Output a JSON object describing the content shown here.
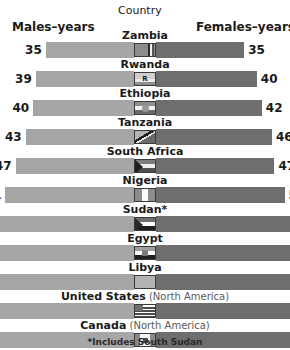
{
  "header": {
    "males_label": "Males–years",
    "females_label": "Females–years",
    "country_label": "Country"
  },
  "footnote": "*Includes South Sudan",
  "colors": {
    "male_bar": "#a6a6a6",
    "female_bar": "#6e6e6e",
    "text": "#1a1a1a",
    "sub_text": "#5a5a5a",
    "background": "#ffffff"
  },
  "chart_data": {
    "type": "bar",
    "title": "Country",
    "subtitle": "",
    "xlabel": "",
    "ylabel": "Country",
    "orientation": "horizontal-diverging",
    "grid": false,
    "legend_position": "top",
    "axis_center_value": 0,
    "categories": [
      "Zambia",
      "Rwanda",
      "Ethiopia",
      "Tanzania",
      "South Africa",
      "Nigeria",
      "Sudan*",
      "Egypt",
      "Libya",
      "United States",
      "Canada"
    ],
    "series": [
      {
        "name": "Males–years",
        "direction": "left",
        "color": "#a6a6a6",
        "values": [
          35,
          39,
          40,
          43,
          47,
          51,
          57,
          68,
          74,
          74,
          76
        ]
      },
      {
        "name": "Females–years",
        "direction": "right",
        "color": "#6e6e6e",
        "values": [
          35,
          40,
          42,
          46,
          47,
          51,
          59,
          73,
          78,
          80,
          83
        ]
      }
    ],
    "annotations": [
      "*Includes South Sudan"
    ]
  },
  "rows": [
    {
      "country": "Zambia",
      "sub": "",
      "male": "35",
      "female": "35",
      "male_val": 35,
      "female_val": 35,
      "flag": "zambia-flag"
    },
    {
      "country": "Rwanda",
      "sub": "",
      "male": "39",
      "female": "40",
      "male_val": 39,
      "female_val": 40,
      "flag": "rwanda-flag"
    },
    {
      "country": "Ethiopia",
      "sub": "",
      "male": "40",
      "female": "42",
      "male_val": 40,
      "female_val": 42,
      "flag": "ethiopia-flag"
    },
    {
      "country": "Tanzania",
      "sub": "",
      "male": "43",
      "female": "46",
      "male_val": 43,
      "female_val": 46,
      "flag": "tanzania-flag"
    },
    {
      "country": "South Africa",
      "sub": "",
      "male": "47",
      "female": "47",
      "male_val": 47,
      "female_val": 47,
      "flag": "south-africa-flag"
    },
    {
      "country": "Nigeria",
      "sub": "",
      "male": "51",
      "female": "51",
      "male_val": 51,
      "female_val": 51,
      "flag": "nigeria-flag"
    },
    {
      "country": "Sudan*",
      "sub": "",
      "male": "57",
      "female": "59",
      "male_val": 57,
      "female_val": 59,
      "flag": "sudan-flag"
    },
    {
      "country": "Egypt",
      "sub": "",
      "male": "68",
      "female": "73",
      "male_val": 68,
      "female_val": 73,
      "flag": "egypt-flag"
    },
    {
      "country": "Libya",
      "sub": "",
      "male": "74",
      "female": "78",
      "male_val": 74,
      "female_val": 78,
      "flag": "libya-flag"
    },
    {
      "country": "United States",
      "sub": " (North America)",
      "male": "74",
      "female": "80",
      "male_val": 74,
      "female_val": 80,
      "flag": "usa-flag"
    },
    {
      "country": "Canada",
      "sub": " (North America)",
      "male": "76",
      "female": "83",
      "male_val": 76,
      "female_val": 83,
      "flag": "canada-flag"
    }
  ]
}
